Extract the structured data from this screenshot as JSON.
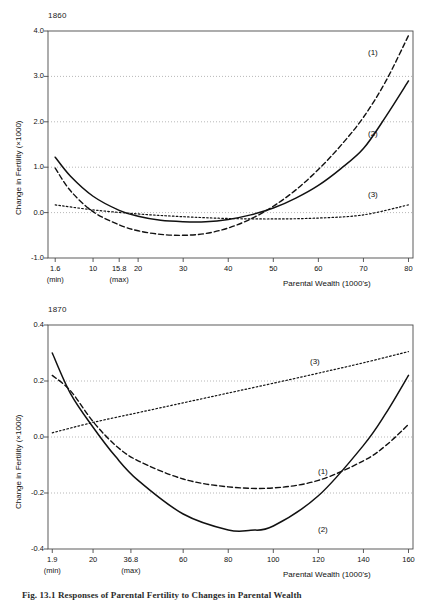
{
  "figure": {
    "caption": "Fig. 13.1   Responses of Parental Fertility to Changes in Parental Wealth"
  },
  "panels": [
    {
      "id": "1860",
      "title": "1860",
      "ylabel": "Change in Fertility (×1000)",
      "xlabel": "Parental Wealth (1000's)",
      "yticks": [
        "-1.0",
        "0.0",
        "1.0",
        "2.0",
        "3.0",
        "4.0"
      ],
      "xticks": [
        "1.6",
        "10",
        "15.8",
        "20",
        "30",
        "40",
        "50",
        "60",
        "70",
        "80"
      ],
      "xtick_notes": [
        {
          "label": "(min)",
          "at": "1.6"
        },
        {
          "label": "(max)",
          "at": "15.8"
        }
      ],
      "curve_labels": [
        "(1)",
        "(2)",
        "(3)"
      ]
    },
    {
      "id": "1870",
      "title": "1870",
      "ylabel": "Change in Fertility (×1000)",
      "xlabel": "Parental Wealth (1000's)",
      "yticks": [
        "-0.4",
        "-0.2",
        "0.0",
        "0.2",
        "0.4"
      ],
      "xticks": [
        "1.9",
        "20",
        "36.8",
        "60",
        "80",
        "100",
        "120",
        "140",
        "160"
      ],
      "xtick_notes": [
        {
          "label": "(min)",
          "at": "1.9"
        },
        {
          "label": "(max)",
          "at": "36.8"
        }
      ],
      "curve_labels": [
        "(3)",
        "(1)",
        "(2)"
      ]
    }
  ],
  "chart_data": [
    {
      "type": "line",
      "title": "1860",
      "xlabel": "Parental Wealth (1000's)",
      "ylabel": "Change in Fertility (×1000)",
      "xlim": [
        0,
        81
      ],
      "ylim": [
        -1.0,
        4.0
      ],
      "xticks": [
        1.6,
        10,
        15.8,
        20,
        30,
        40,
        50,
        60,
        70,
        80
      ],
      "yticks": [
        -1.0,
        0.0,
        1.0,
        2.0,
        3.0,
        4.0
      ],
      "grid": "horizontal-dotted",
      "legend": "inline-curve-labels",
      "annotations": [
        {
          "text": "(min)",
          "x": 1.6,
          "axis": "x"
        },
        {
          "text": "(max)",
          "x": 15.8,
          "axis": "x"
        }
      ],
      "series": [
        {
          "name": "(1)",
          "style": "dashed",
          "x": [
            1.6,
            5,
            10,
            15.8,
            20,
            25,
            30,
            35,
            40,
            45,
            50,
            55,
            60,
            65,
            70,
            75,
            80
          ],
          "y": [
            0.98,
            0.48,
            0.02,
            -0.27,
            -0.4,
            -0.48,
            -0.5,
            -0.46,
            -0.34,
            -0.14,
            0.14,
            0.5,
            0.95,
            1.48,
            2.1,
            2.9,
            3.9
          ]
        },
        {
          "name": "(2)",
          "style": "solid",
          "x": [
            1.6,
            5,
            10,
            15.8,
            20,
            25,
            30,
            35,
            40,
            45,
            50,
            55,
            60,
            65,
            70,
            75,
            80
          ],
          "y": [
            1.22,
            0.8,
            0.36,
            0.05,
            -0.08,
            -0.17,
            -0.2,
            -0.2,
            -0.15,
            -0.05,
            0.1,
            0.32,
            0.6,
            0.97,
            1.41,
            2.12,
            2.9
          ]
        },
        {
          "name": "(3)",
          "style": "dotted",
          "x": [
            1.6,
            10,
            20,
            30,
            40,
            50,
            60,
            70,
            80
          ],
          "y": [
            0.17,
            0.06,
            -0.03,
            -0.09,
            -0.13,
            -0.14,
            -0.12,
            -0.05,
            0.17
          ]
        }
      ]
    },
    {
      "type": "line",
      "title": "1870",
      "xlabel": "Parental Wealth (1000's)",
      "ylabel": "Change in Fertility (×1000)",
      "xlim": [
        0,
        162
      ],
      "ylim": [
        -0.4,
        0.4
      ],
      "xticks": [
        1.9,
        20,
        36.8,
        60,
        80,
        100,
        120,
        140,
        160
      ],
      "yticks": [
        -0.4,
        -0.2,
        0.0,
        0.2,
        0.4
      ],
      "grid": "horizontal-dotted",
      "legend": "inline-curve-labels",
      "annotations": [
        {
          "text": "(min)",
          "x": 1.9,
          "axis": "x"
        },
        {
          "text": "(max)",
          "x": 36.8,
          "axis": "x"
        }
      ],
      "series": [
        {
          "name": "(1)",
          "style": "dashed",
          "x": [
            1.9,
            10,
            20,
            30,
            40,
            60,
            80,
            100,
            120,
            140,
            150,
            160
          ],
          "y": [
            0.22,
            0.165,
            0.055,
            -0.03,
            -0.085,
            -0.15,
            -0.178,
            -0.182,
            -0.155,
            -0.085,
            -0.03,
            0.045
          ]
        },
        {
          "name": "(2)",
          "style": "solid",
          "x": [
            1.9,
            10,
            20,
            30,
            40,
            60,
            80,
            90,
            100,
            120,
            140,
            150,
            160
          ],
          "y": [
            0.3,
            0.155,
            0.035,
            -0.07,
            -0.155,
            -0.275,
            -0.332,
            -0.333,
            -0.318,
            -0.21,
            -0.03,
            0.085,
            0.22
          ]
        },
        {
          "name": "(3)",
          "style": "dotted",
          "x": [
            1.9,
            20,
            40,
            60,
            80,
            100,
            120,
            140,
            160
          ],
          "y": [
            0.015,
            0.052,
            0.087,
            0.122,
            0.157,
            0.192,
            0.228,
            0.265,
            0.305
          ]
        }
      ]
    }
  ]
}
